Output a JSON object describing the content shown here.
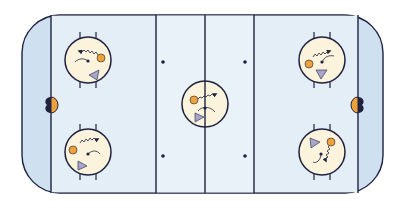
{
  "diagram": {
    "type": "hockey-rink-drill",
    "colors": {
      "ice_outer": "#cfe1f0",
      "ice_inner": "#e4eef6",
      "lines": "#1f2140",
      "circle_fill": "#fbf3dc",
      "puck_orange": "#f0a23a",
      "player_triangle": "#a8a6cc",
      "background": "#ffffff"
    },
    "rink": {
      "x": 22,
      "y": 15,
      "width": 361,
      "height": 178,
      "corner_radius": 38
    },
    "lines": [
      {
        "name": "left-goal-line",
        "x": 51
      },
      {
        "name": "left-blue-line",
        "x": 156
      },
      {
        "name": "center-line",
        "x": 205
      },
      {
        "name": "right-blue-line",
        "x": 254
      },
      {
        "name": "right-goal-line",
        "x": 358
      }
    ],
    "goals": [
      {
        "name": "left-goal",
        "x": 51,
        "y": 105,
        "side": "left"
      },
      {
        "name": "right-goal",
        "x": 358,
        "y": 105,
        "side": "right"
      }
    ],
    "faceoff_dots": [
      {
        "x": 163,
        "y": 62
      },
      {
        "x": 245,
        "y": 62
      },
      {
        "x": 163,
        "y": 156
      },
      {
        "x": 245,
        "y": 156
      }
    ],
    "faceoff_circles": [
      {
        "name": "top-left-circle",
        "cx": 88,
        "cy": 60,
        "r": 23,
        "hashes": true
      },
      {
        "name": "bottom-left-circle",
        "cx": 88,
        "cy": 152,
        "r": 23,
        "hashes": true
      },
      {
        "name": "center-circle",
        "cx": 205,
        "cy": 104,
        "r": 23,
        "hashes": false
      },
      {
        "name": "top-right-circle",
        "cx": 322,
        "cy": 60,
        "r": 23,
        "hashes": true
      },
      {
        "name": "bottom-right-circle",
        "cx": 322,
        "cy": 152,
        "r": 23,
        "hashes": true
      }
    ]
  }
}
